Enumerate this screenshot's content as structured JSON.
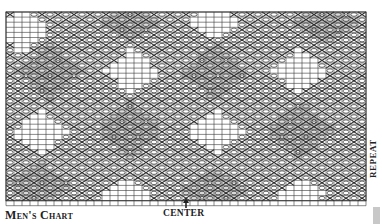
{
  "title": "Men's Chart",
  "labels": {
    "center": "CENTER",
    "repeat": "REPEAT"
  },
  "colors": {
    "grid": "#3a3a3a",
    "background": "#ffffff",
    "motif": "#2a2a2a",
    "text": "#222222",
    "scrollbar": "#c8c8c8"
  },
  "grid": {
    "left": 6,
    "top": 12,
    "cols": 45,
    "rows": 37,
    "cell_w": 8,
    "cell_h": 5.1,
    "tick_row_height": 5
  },
  "center_arrow": {
    "x": 186,
    "y_top": 199,
    "y_bottom": 208
  },
  "diamonds": {
    "plain": [
      {
        "cx": 22,
        "cy": 30,
        "rx": 28,
        "ry": 24
      },
      {
        "cx": 132,
        "cy": 72,
        "rx": 28,
        "ry": 24
      },
      {
        "cx": 215,
        "cy": 22,
        "rx": 26,
        "ry": 20
      },
      {
        "cx": 300,
        "cy": 72,
        "rx": 28,
        "ry": 24
      },
      {
        "cx": 40,
        "cy": 132,
        "rx": 28,
        "ry": 24
      },
      {
        "cx": 215,
        "cy": 132,
        "rx": 28,
        "ry": 24
      },
      {
        "cx": 125,
        "cy": 195,
        "rx": 26,
        "ry": 18
      },
      {
        "cx": 300,
        "cy": 195,
        "rx": 26,
        "ry": 18
      }
    ],
    "dotted": [
      {
        "cx": 50,
        "cy": 72,
        "rx": 34,
        "ry": 30
      },
      {
        "cx": 130,
        "cy": 22,
        "rx": 34,
        "ry": 22
      },
      {
        "cx": 215,
        "cy": 72,
        "rx": 34,
        "ry": 30
      },
      {
        "cx": 325,
        "cy": 22,
        "rx": 34,
        "ry": 22
      },
      {
        "cx": 130,
        "cy": 130,
        "rx": 34,
        "ry": 30
      },
      {
        "cx": 300,
        "cy": 130,
        "rx": 34,
        "ry": 30
      },
      {
        "cx": 40,
        "cy": 185,
        "rx": 34,
        "ry": 24
      },
      {
        "cx": 215,
        "cy": 190,
        "rx": 34,
        "ry": 22
      }
    ]
  }
}
